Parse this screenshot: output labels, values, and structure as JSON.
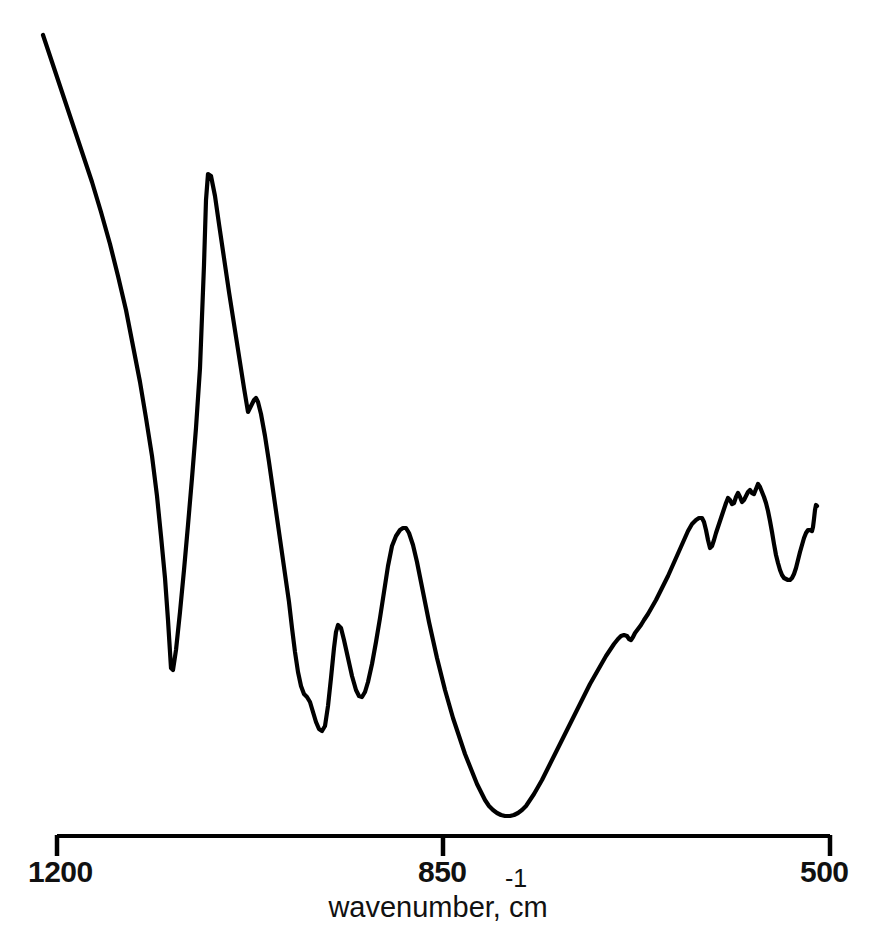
{
  "figure": {
    "background_color": "#ffffff",
    "line_color": "#000000",
    "axis_color": "#000000"
  },
  "axis": {
    "title_text": "wavenumber, cm",
    "title_exponent": "-1",
    "tick_labels": {
      "left": "1200",
      "middle": "850",
      "right": "500"
    },
    "tick_values": [
      1200,
      850,
      500
    ],
    "line_width_px": 4,
    "tick_length_px": 20
  },
  "chart_data": {
    "type": "line",
    "title": "",
    "subtitle": "",
    "xlabel": "wavenumber, cm-1",
    "ylabel": "",
    "xlim": [
      1200,
      500
    ],
    "ylim": [
      0,
      1
    ],
    "x_reversed": true,
    "grid": false,
    "legend": null,
    "xticks": [
      1200,
      850,
      500
    ],
    "xticklabels": [
      "1200",
      "850",
      "500"
    ],
    "yticks": [],
    "yticklabels": [],
    "series": [
      {
        "name": "transmittance",
        "notes": "Infrared absorbance trace, fingerprint region 1200-500 cm-1",
        "features": [
          {
            "kind": "trace-start",
            "x": 1200,
            "y_px": 35
          },
          {
            "kind": "minimum",
            "label": "strong band",
            "x": 1087,
            "y_px": 670
          },
          {
            "kind": "maximum",
            "label": "main peak",
            "x": 1052,
            "y_px": 173
          },
          {
            "kind": "shoulder-min",
            "x": 1019,
            "y_px": 412
          },
          {
            "kind": "shoulder-max",
            "x": 1012,
            "y_px": 398
          },
          {
            "kind": "minimum",
            "x": 964,
            "y_px": 730
          },
          {
            "kind": "maximum",
            "x": 950,
            "y_px": 625
          },
          {
            "kind": "minimum",
            "x": 929,
            "y_px": 697
          },
          {
            "kind": "maximum",
            "label": "mid peak",
            "x": 891,
            "y_px": 528
          },
          {
            "kind": "minimum",
            "label": "broad deep band",
            "x": 796,
            "y_px": 815
          },
          {
            "kind": "shoulder",
            "x": 706,
            "y_px": 637
          },
          {
            "kind": "maximum",
            "x": 636,
            "y_px": 518
          },
          {
            "kind": "minimum",
            "x": 630,
            "y_px": 548
          },
          {
            "kind": "maximum",
            "label": "jagged crest",
            "x": 586,
            "y_px": 484
          },
          {
            "kind": "minimum",
            "x": 557,
            "y_px": 580
          },
          {
            "kind": "trace-end",
            "x": 521,
            "y_px": 505
          }
        ],
        "path_points_px": [
          [
            43,
            35
          ],
          [
            52,
            62
          ],
          [
            62,
            92
          ],
          [
            72,
            122
          ],
          [
            82,
            152
          ],
          [
            92,
            182
          ],
          [
            101,
            212
          ],
          [
            110,
            244
          ],
          [
            118,
            276
          ],
          [
            126,
            310
          ],
          [
            133,
            346
          ],
          [
            140,
            382
          ],
          [
            146,
            418
          ],
          [
            152,
            456
          ],
          [
            157,
            496
          ],
          [
            161,
            536
          ],
          [
            165,
            578
          ],
          [
            168,
            620
          ],
          [
            170,
            652
          ],
          [
            171,
            668
          ],
          [
            173,
            670
          ],
          [
            176,
            650
          ],
          [
            180,
            612
          ],
          [
            184,
            570
          ],
          [
            188,
            525
          ],
          [
            192,
            478
          ],
          [
            196,
            428
          ],
          [
            200,
            368
          ],
          [
            204,
            265
          ],
          [
            206,
            200
          ],
          [
            208,
            174
          ],
          [
            211,
            176
          ],
          [
            215,
            196
          ],
          [
            219,
            224
          ],
          [
            224,
            258
          ],
          [
            229,
            292
          ],
          [
            234,
            324
          ],
          [
            239,
            356
          ],
          [
            244,
            388
          ],
          [
            247,
            406
          ],
          [
            248,
            412
          ],
          [
            251,
            406
          ],
          [
            254,
            400
          ],
          [
            256,
            398
          ],
          [
            258,
            402
          ],
          [
            261,
            414
          ],
          [
            265,
            436
          ],
          [
            269,
            462
          ],
          [
            273,
            490
          ],
          [
            277,
            518
          ],
          [
            281,
            546
          ],
          [
            285,
            574
          ],
          [
            289,
            602
          ],
          [
            292,
            628
          ],
          [
            295,
            652
          ],
          [
            298,
            672
          ],
          [
            301,
            686
          ],
          [
            304,
            694
          ],
          [
            307,
            697
          ],
          [
            310,
            702
          ],
          [
            313,
            712
          ],
          [
            316,
            722
          ],
          [
            319,
            729
          ],
          [
            322,
            731
          ],
          [
            325,
            726
          ],
          [
            328,
            706
          ],
          [
            331,
            678
          ],
          [
            334,
            648
          ],
          [
            336,
            632
          ],
          [
            338,
            625
          ],
          [
            341,
            628
          ],
          [
            344,
            640
          ],
          [
            348,
            658
          ],
          [
            352,
            676
          ],
          [
            356,
            690
          ],
          [
            359,
            696
          ],
          [
            362,
            697
          ],
          [
            365,
            692
          ],
          [
            368,
            682
          ],
          [
            372,
            664
          ],
          [
            376,
            642
          ],
          [
            380,
            618
          ],
          [
            384,
            592
          ],
          [
            388,
            566
          ],
          [
            392,
            546
          ],
          [
            396,
            536
          ],
          [
            400,
            530
          ],
          [
            403,
            528
          ],
          [
            406,
            528
          ],
          [
            409,
            533
          ],
          [
            413,
            545
          ],
          [
            417,
            562
          ],
          [
            421,
            582
          ],
          [
            425,
            602
          ],
          [
            429,
            622
          ],
          [
            433,
            640
          ],
          [
            437,
            658
          ],
          [
            441,
            674
          ],
          [
            445,
            690
          ],
          [
            449,
            704
          ],
          [
            453,
            718
          ],
          [
            457,
            730
          ],
          [
            461,
            742
          ],
          [
            465,
            754
          ],
          [
            469,
            764
          ],
          [
            473,
            774
          ],
          [
            477,
            784
          ],
          [
            481,
            792
          ],
          [
            485,
            800
          ],
          [
            489,
            806
          ],
          [
            493,
            810
          ],
          [
            497,
            813
          ],
          [
            501,
            815
          ],
          [
            505,
            816
          ],
          [
            510,
            816
          ],
          [
            514,
            815
          ],
          [
            518,
            813
          ],
          [
            522,
            810
          ],
          [
            526,
            806
          ],
          [
            530,
            800
          ],
          [
            534,
            794
          ],
          [
            538,
            787
          ],
          [
            542,
            780
          ],
          [
            546,
            772
          ],
          [
            550,
            764
          ],
          [
            554,
            756
          ],
          [
            558,
            748
          ],
          [
            562,
            740
          ],
          [
            566,
            732
          ],
          [
            570,
            724
          ],
          [
            574,
            716
          ],
          [
            578,
            708
          ],
          [
            582,
            700
          ],
          [
            586,
            692
          ],
          [
            590,
            684
          ],
          [
            594,
            677
          ],
          [
            598,
            670
          ],
          [
            602,
            663
          ],
          [
            606,
            656
          ],
          [
            610,
            650
          ],
          [
            614,
            644
          ],
          [
            618,
            639
          ],
          [
            621,
            636
          ],
          [
            624,
            635
          ],
          [
            627,
            636
          ],
          [
            629,
            639
          ],
          [
            631,
            640
          ],
          [
            633,
            637
          ],
          [
            635,
            633
          ],
          [
            638,
            629
          ],
          [
            641,
            625
          ],
          [
            644,
            620
          ],
          [
            648,
            614
          ],
          [
            652,
            607
          ],
          [
            656,
            600
          ],
          [
            660,
            592
          ],
          [
            664,
            584
          ],
          [
            668,
            576
          ],
          [
            672,
            567
          ],
          [
            676,
            558
          ],
          [
            680,
            549
          ],
          [
            684,
            540
          ],
          [
            688,
            531
          ],
          [
            692,
            524
          ],
          [
            696,
            520
          ],
          [
            699,
            518
          ],
          [
            702,
            518
          ],
          [
            704,
            522
          ],
          [
            706,
            530
          ],
          [
            708,
            540
          ],
          [
            710,
            548
          ],
          [
            712,
            546
          ],
          [
            714,
            540
          ],
          [
            716,
            533
          ],
          [
            718,
            527
          ],
          [
            720,
            521
          ],
          [
            722,
            515
          ],
          [
            724,
            509
          ],
          [
            726,
            503
          ],
          [
            728,
            498
          ],
          [
            730,
            500
          ],
          [
            732,
            504
          ],
          [
            734,
            503
          ],
          [
            736,
            497
          ],
          [
            738,
            493
          ],
          [
            740,
            497
          ],
          [
            742,
            502
          ],
          [
            744,
            500
          ],
          [
            746,
            496
          ],
          [
            748,
            492
          ],
          [
            750,
            490
          ],
          [
            752,
            493
          ],
          [
            754,
            494
          ],
          [
            756,
            489
          ],
          [
            758,
            484
          ],
          [
            760,
            487
          ],
          [
            762,
            492
          ],
          [
            764,
            497
          ],
          [
            766,
            503
          ],
          [
            768,
            511
          ],
          [
            770,
            521
          ],
          [
            772,
            532
          ],
          [
            774,
            544
          ],
          [
            776,
            555
          ],
          [
            778,
            563
          ],
          [
            780,
            570
          ],
          [
            782,
            575
          ],
          [
            784,
            578
          ],
          [
            786,
            579
          ],
          [
            788,
            580
          ],
          [
            790,
            580
          ],
          [
            792,
            578
          ],
          [
            794,
            574
          ],
          [
            796,
            568
          ],
          [
            798,
            560
          ],
          [
            800,
            552
          ],
          [
            802,
            545
          ],
          [
            804,
            538
          ],
          [
            806,
            533
          ],
          [
            808,
            530
          ],
          [
            810,
            530
          ],
          [
            812,
            531
          ],
          [
            813,
            527
          ],
          [
            814,
            519
          ],
          [
            815,
            510
          ],
          [
            816,
            505
          ],
          [
            817,
            506
          ]
        ]
      }
    ]
  },
  "geometry": {
    "axis_y_px": 836,
    "axis_x_left_px": 57,
    "axis_x_mid_px": 443,
    "axis_x_right_px": 830
  }
}
